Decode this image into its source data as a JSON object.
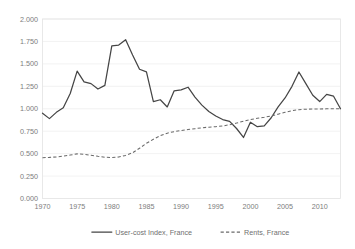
{
  "chart_data": {
    "type": "line",
    "title": "",
    "xlabel": "",
    "ylabel": "",
    "xlim": [
      1970,
      2013
    ],
    "ylim": [
      0.0,
      2.0
    ],
    "grid": true,
    "legend_position": "bottom-center",
    "y_ticks": [
      "0.000",
      "0.250",
      "0.500",
      "0.750",
      "1.000",
      "1.250",
      "1.500",
      "1.750",
      "2.000"
    ],
    "y_tick_values": [
      0.0,
      0.25,
      0.5,
      0.75,
      1.0,
      1.25,
      1.5,
      1.75,
      2.0
    ],
    "x_ticks": [
      "1970",
      "1975",
      "1980",
      "1985",
      "1990",
      "1995",
      "2000",
      "2005",
      "2010"
    ],
    "x_tick_values": [
      1970,
      1975,
      1980,
      1985,
      1990,
      1995,
      2000,
      2005,
      2010
    ],
    "x": [
      1970,
      1971,
      1972,
      1973,
      1974,
      1975,
      1976,
      1977,
      1978,
      1979,
      1980,
      1981,
      1982,
      1983,
      1984,
      1985,
      1986,
      1987,
      1988,
      1989,
      1990,
      1991,
      1992,
      1993,
      1994,
      1995,
      1996,
      1997,
      1998,
      1999,
      2000,
      2001,
      2002,
      2003,
      2004,
      2005,
      2006,
      2007,
      2008,
      2009,
      2010,
      2011,
      2012,
      2013
    ],
    "series": [
      {
        "name": "User-cost Index, France",
        "style": "solid",
        "color": "#454545",
        "values": [
          0.95,
          0.89,
          0.96,
          1.01,
          1.17,
          1.42,
          1.3,
          1.28,
          1.22,
          1.26,
          1.7,
          1.71,
          1.77,
          1.6,
          1.44,
          1.41,
          1.08,
          1.1,
          1.02,
          1.2,
          1.21,
          1.24,
          1.13,
          1.04,
          0.97,
          0.92,
          0.88,
          0.86,
          0.78,
          0.68,
          0.85,
          0.8,
          0.81,
          0.9,
          1.02,
          1.12,
          1.25,
          1.41,
          1.28,
          1.15,
          1.08,
          1.16,
          1.14,
          1.0
        ]
      },
      {
        "name": "Rents, France",
        "style": "dashed",
        "color": "#6a6a6a",
        "values": [
          0.455,
          0.458,
          0.463,
          0.472,
          0.484,
          0.497,
          0.492,
          0.482,
          0.47,
          0.46,
          0.456,
          0.462,
          0.48,
          0.51,
          0.56,
          0.615,
          0.66,
          0.7,
          0.728,
          0.745,
          0.757,
          0.768,
          0.778,
          0.788,
          0.795,
          0.8,
          0.808,
          0.822,
          0.84,
          0.862,
          0.88,
          0.893,
          0.905,
          0.92,
          0.94,
          0.96,
          0.978,
          0.99,
          0.995,
          0.997,
          0.998,
          0.999,
          1.0,
          1.0
        ]
      }
    ]
  },
  "legend": {
    "items": [
      {
        "label": "User-cost Index, France",
        "style": "solid"
      },
      {
        "label": "Rents, France",
        "style": "dashed"
      }
    ]
  },
  "colors": {
    "user_cost_line": "#454545",
    "rents_line": "#6a6a6a",
    "gridline": "#ededed",
    "frame": "#e3e3e3",
    "text": "#7d7d7d",
    "background": "#ffffff"
  }
}
